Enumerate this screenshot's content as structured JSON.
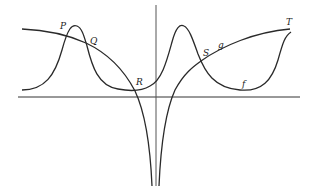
{
  "diagram": {
    "title": "",
    "type": "function graphs with intersection points",
    "axes": {
      "x_axis": "horizontal",
      "y_axis": "vertical"
    },
    "curves": [
      {
        "name": "f",
        "label": "f",
        "description": "oscillating curve with two peaks"
      },
      {
        "name": "g",
        "label": "g",
        "description": "curve with vertical asymptote at origin"
      }
    ],
    "points": [
      {
        "label": "P"
      },
      {
        "label": "Q"
      },
      {
        "label": "R"
      },
      {
        "label": "S"
      },
      {
        "label": "T"
      }
    ],
    "colors": {
      "stroke": "#2a2a2a",
      "axis": "#333333",
      "background": "#ffffff"
    }
  }
}
